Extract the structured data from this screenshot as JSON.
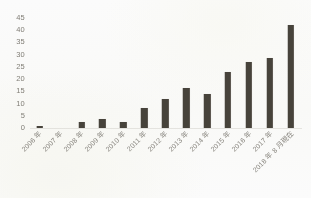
{
  "chart_data": {
    "type": "bar",
    "title": "",
    "subtitle": "",
    "xlabel": "",
    "ylabel": "",
    "ylim": [
      0,
      45
    ],
    "ytick_step": 5,
    "yticks": [
      "45",
      "40",
      "35",
      "30",
      "25",
      "20",
      "15",
      "10",
      "5",
      "0"
    ],
    "grid": false,
    "legend": false,
    "legend_position": "none",
    "bar_color": "#413d35",
    "background_color": "#fefefe",
    "axis_label_color": "#7d7a72",
    "categories": [
      "2006 年",
      "2007 年",
      "2008 年",
      "2009 年",
      "2010 年",
      "2011 年",
      "2012 年",
      "2013 年",
      "2014 年",
      "2015 年",
      "2016 年",
      "2017 年",
      "2018 年 8 月現在"
    ],
    "values": [
      1,
      0,
      2.5,
      3.5,
      2.5,
      8,
      12,
      16.5,
      14,
      23,
      27,
      28.5,
      42
    ]
  }
}
